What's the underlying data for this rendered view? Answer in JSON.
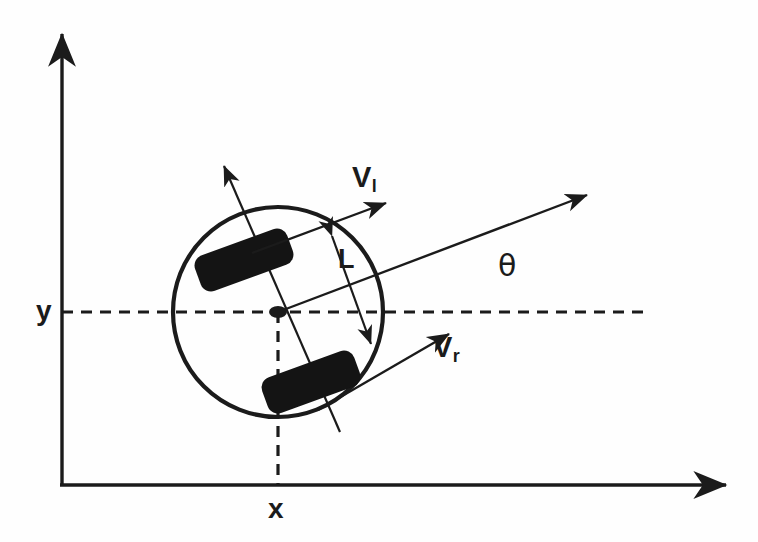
{
  "diagram": {
    "background_color": "#fefefe",
    "ink_color": "#1b1b1b",
    "wheel_color": "#141414",
    "canvas": {
      "width": 758,
      "height": 542
    }
  },
  "labels": {
    "velocity_left": {
      "base": "V",
      "subscript": "l"
    },
    "velocity_right": {
      "base": "V",
      "subscript": "r"
    },
    "heading_angle": "θ",
    "wheelbase": "L",
    "axis_y": "y",
    "axis_x": "x"
  },
  "axes": {
    "origin": {
      "x": 62,
      "y": 485
    },
    "y_axis": {
      "from_x": 62,
      "from_y": 485,
      "to_x": 62,
      "to_y": 30,
      "arrow": "up"
    },
    "x_axis": {
      "from_x": 62,
      "from_y": 485,
      "to_x": 730,
      "to_y": 485,
      "arrow": "right"
    }
  },
  "robot": {
    "center": {
      "x": 278,
      "y": 312
    },
    "body_radius": 105,
    "body_stroke_width": 4,
    "heading_deg": 17,
    "wheel_axis_deg": 73,
    "center_dot_rx": 9,
    "center_dot_ry": 6
  },
  "guides": {
    "dashed_horizontal": {
      "y": 312,
      "from_x": 62,
      "to_x": 650
    },
    "dashed_vertical": {
      "x": 278,
      "from_y": 312,
      "to_y": 485
    }
  },
  "vectors": {
    "heading_arrow": {
      "from_x": 278,
      "from_y": 312,
      "to_x": 593,
      "to_y": 192
    },
    "v_left_arrow": {
      "from_x": 252,
      "from_y": 253,
      "to_x": 392,
      "to_y": 200
    },
    "v_right_arrow": {
      "from_x": 318,
      "from_y": 410,
      "to_x": 455,
      "to_y": 330
    },
    "wheel_axis_arrow": {
      "from_x": 340,
      "from_y": 432,
      "to_x": 220,
      "to_y": 160
    },
    "wheelbase_arrow": {
      "from_x": 328,
      "from_y": 228,
      "to_x": 374,
      "to_y": 352
    }
  },
  "wheels": [
    {
      "name": "left-wheel",
      "cx": 244,
      "cy": 260,
      "width": 98,
      "height": 38,
      "rotation_deg": -20
    },
    {
      "name": "right-wheel",
      "cx": 311,
      "cy": 382,
      "width": 98,
      "height": 38,
      "rotation_deg": -20
    }
  ]
}
